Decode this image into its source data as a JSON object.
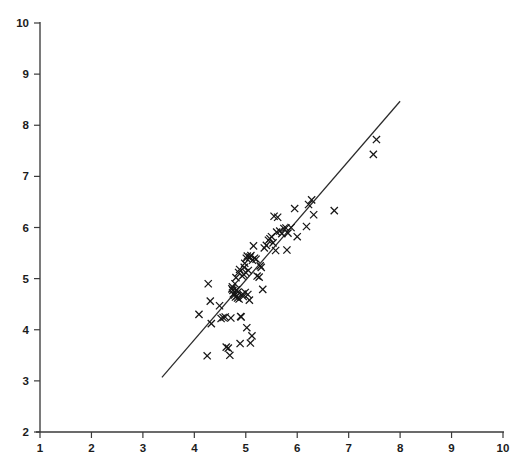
{
  "chart_data": {
    "type": "scatter",
    "title": "",
    "subtitle": "",
    "xlabel": "",
    "ylabel": "",
    "xlim": [
      1,
      10
    ],
    "ylim": [
      2,
      10
    ],
    "xticks": [
      1,
      2,
      3,
      4,
      5,
      6,
      7,
      8,
      9,
      10
    ],
    "yticks": [
      2,
      3,
      4,
      5,
      6,
      7,
      8,
      9,
      10
    ],
    "xtick_labels": [
      "1",
      "2",
      "3",
      "4",
      "5",
      "6",
      "7",
      "8",
      "9",
      "10"
    ],
    "ytick_labels": [
      "2",
      "3",
      "4",
      "5",
      "6",
      "7",
      "8",
      "9",
      "10"
    ],
    "grid": false,
    "legend": null,
    "marker_style": "x",
    "marker_color": "#161616",
    "line_color": "#2a2a2a",
    "axis_color": "#3a3a3a",
    "background_color": "#ffffff",
    "annotations": [],
    "series": [
      {
        "name": "observations",
        "type": "scatter",
        "marker": "x",
        "points": [
          [
            4.09,
            4.3
          ],
          [
            4.27,
            4.9
          ],
          [
            4.31,
            4.56
          ],
          [
            4.33,
            4.12
          ],
          [
            4.25,
            3.49
          ],
          [
            4.49,
            4.47
          ],
          [
            4.52,
            4.22
          ],
          [
            4.56,
            4.24
          ],
          [
            4.6,
            4.25
          ],
          [
            4.62,
            3.66
          ],
          [
            4.66,
            3.64
          ],
          [
            4.69,
            3.5
          ],
          [
            4.71,
            4.23
          ],
          [
            4.73,
            4.8
          ],
          [
            4.74,
            4.84
          ],
          [
            4.75,
            4.77
          ],
          [
            4.76,
            4.7
          ],
          [
            4.78,
            4.68
          ],
          [
            4.79,
            4.9
          ],
          [
            4.8,
            4.64
          ],
          [
            4.81,
            5.02
          ],
          [
            4.82,
            4.78
          ],
          [
            4.83,
            4.66
          ],
          [
            4.84,
            4.62
          ],
          [
            4.85,
            4.74
          ],
          [
            4.86,
            5.12
          ],
          [
            4.87,
            4.6
          ],
          [
            4.88,
            5.18
          ],
          [
            4.89,
            3.73
          ],
          [
            4.9,
            4.26
          ],
          [
            4.91,
            4.25
          ],
          [
            4.93,
            5.05
          ],
          [
            4.94,
            4.7
          ],
          [
            4.95,
            4.65
          ],
          [
            4.96,
            5.08
          ],
          [
            4.97,
            5.22
          ],
          [
            4.98,
            5.3
          ],
          [
            4.99,
            4.73
          ],
          [
            5.0,
            5.12
          ],
          [
            5.01,
            5.4
          ],
          [
            5.02,
            4.04
          ],
          [
            5.03,
            5.44
          ],
          [
            5.04,
            4.69
          ],
          [
            5.05,
            5.16
          ],
          [
            5.07,
            4.58
          ],
          [
            5.08,
            5.42
          ],
          [
            5.09,
            3.74
          ],
          [
            5.1,
            5.45
          ],
          [
            5.12,
            3.88
          ],
          [
            5.13,
            5.36
          ],
          [
            5.15,
            5.64
          ],
          [
            5.17,
            5.4
          ],
          [
            5.2,
            5.38
          ],
          [
            5.22,
            5.05
          ],
          [
            5.26,
            5.03
          ],
          [
            5.28,
            5.25
          ],
          [
            5.3,
            5.22
          ],
          [
            5.33,
            4.79
          ],
          [
            5.36,
            5.6
          ],
          [
            5.4,
            5.65
          ],
          [
            5.44,
            5.75
          ],
          [
            5.47,
            5.78
          ],
          [
            5.5,
            5.82
          ],
          [
            5.53,
            5.7
          ],
          [
            5.55,
            6.22
          ],
          [
            5.58,
            5.55
          ],
          [
            5.6,
            5.91
          ],
          [
            5.62,
            6.2
          ],
          [
            5.66,
            5.93
          ],
          [
            5.7,
            5.88
          ],
          [
            5.74,
            5.98
          ],
          [
            5.78,
            5.99
          ],
          [
            5.8,
            5.56
          ],
          [
            5.82,
            5.89
          ],
          [
            5.88,
            6.0
          ],
          [
            5.95,
            6.37
          ],
          [
            6.0,
            5.82
          ],
          [
            6.18,
            6.02
          ],
          [
            6.22,
            6.45
          ],
          [
            6.28,
            6.54
          ],
          [
            6.32,
            6.25
          ],
          [
            6.72,
            6.33
          ],
          [
            7.48,
            7.43
          ],
          [
            7.54,
            7.72
          ]
        ]
      },
      {
        "name": "fitted-line",
        "type": "line",
        "points": [
          [
            3.37,
            3.07
          ],
          [
            8.0,
            8.47
          ]
        ]
      }
    ]
  },
  "figure": {
    "width": 525,
    "height": 469,
    "plot_left_px": 40,
    "plot_bottom_px": 432,
    "plot_right_px": 503,
    "plot_top_px": 23
  }
}
